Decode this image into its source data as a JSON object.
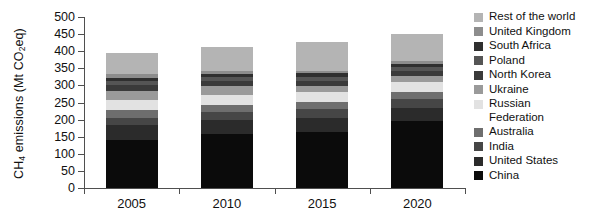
{
  "chart_data": {
    "type": "bar",
    "subtype": "stacked-bar",
    "title": "",
    "xlabel": "",
    "ylabel": "CH4 emissions (Mt CO2eq)",
    "ylabel_rich": {
      "prefix": "CH",
      "sub1": "4",
      "mid": " emissions (Mt CO",
      "sub2": "2",
      "suffix": "eq)"
    },
    "categories": [
      "2005",
      "2010",
      "2015",
      "2020"
    ],
    "ylim": [
      0,
      500
    ],
    "yticks": [
      0,
      50,
      100,
      150,
      200,
      250,
      300,
      350,
      400,
      450,
      500
    ],
    "ytick_labels": [
      "0",
      "50",
      "100",
      "150",
      "200",
      "250",
      "300",
      "350",
      "400",
      "450",
      "500"
    ],
    "grid": false,
    "legend_position": "right",
    "stack_order_bottom_to_top": [
      "China",
      "United States",
      "India",
      "Australia",
      "Russian Federation",
      "Ukraine",
      "North Korea",
      "Poland",
      "South Africa",
      "United Kingdom",
      "Rest of the world"
    ],
    "series": [
      {
        "name": "China",
        "color": "#0b0b0b",
        "values": [
          140,
          157,
          165,
          196
        ]
      },
      {
        "name": "United States",
        "color": "#2b2b2b",
        "values": [
          44,
          42,
          41,
          39
        ]
      },
      {
        "name": "India",
        "color": "#464646",
        "values": [
          22,
          23,
          24,
          25
        ]
      },
      {
        "name": "Australia",
        "color": "#6e6e6e",
        "values": [
          22,
          22,
          21,
          20
        ]
      },
      {
        "name": "Russian Federation",
        "color": "#e2e2e2",
        "values": [
          30,
          29,
          29,
          30
        ]
      },
      {
        "name": "Ukraine",
        "color": "#9a9a9a",
        "values": [
          27,
          24,
          17,
          17
        ]
      },
      {
        "name": "North Korea",
        "color": "#3a3a3a",
        "values": [
          15,
          15,
          16,
          16
        ]
      },
      {
        "name": "Poland",
        "color": "#555555",
        "values": [
          13,
          12,
          12,
          11
        ]
      },
      {
        "name": "South Africa",
        "color": "#2f2f2f",
        "values": [
          10,
          10,
          10,
          10
        ]
      },
      {
        "name": "United Kingdom",
        "color": "#8d8d8d",
        "values": [
          10,
          8,
          7,
          6
        ]
      },
      {
        "name": "Rest of the world",
        "color": "#b4b4b4",
        "values": [
          62,
          70,
          85,
          80
        ]
      }
    ],
    "bar_totals": [
      395,
      412,
      427,
      450
    ]
  },
  "legend": {
    "items": [
      {
        "label": "Rest of the world",
        "color": "#b4b4b4"
      },
      {
        "label": "United Kingdom",
        "color": "#8d8d8d"
      },
      {
        "label": "South Africa",
        "color": "#2f2f2f"
      },
      {
        "label": "Poland",
        "color": "#555555"
      },
      {
        "label": "North Korea",
        "color": "#3a3a3a"
      },
      {
        "label": "Ukraine",
        "color": "#9a9a9a"
      },
      {
        "label": "Russian\nFederation",
        "color": "#e2e2e2"
      },
      {
        "label": "Australia",
        "color": "#6e6e6e"
      },
      {
        "label": "India",
        "color": "#464646"
      },
      {
        "label": "United States",
        "color": "#2b2b2b"
      },
      {
        "label": "China",
        "color": "#0b0b0b"
      }
    ]
  },
  "axes": {
    "line_color": "#4f4f4f",
    "text_color": "#111111"
  }
}
